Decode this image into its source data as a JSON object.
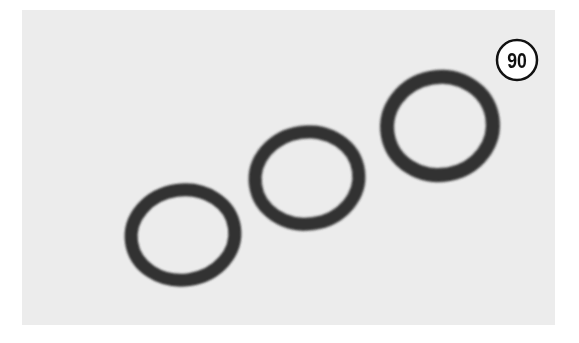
{
  "figure": {
    "background_color": "#ececec",
    "border_color": "#ffffff",
    "ring_color": "#333333",
    "callout": {
      "label": "90",
      "fill": "#ffffff",
      "stroke": "#111111"
    },
    "parts": [
      {
        "name": "o-ring-1",
        "cx": 183,
        "cy": 235,
        "rx": 52,
        "ry": 45,
        "stroke_width": 13,
        "rotate": -8
      },
      {
        "name": "o-ring-2",
        "cx": 307,
        "cy": 178,
        "rx": 52,
        "ry": 46,
        "stroke_width": 13,
        "rotate": -8
      },
      {
        "name": "o-ring-3",
        "cx": 440,
        "cy": 126,
        "rx": 53,
        "ry": 49,
        "stroke_width": 14,
        "rotate": -10
      }
    ]
  }
}
